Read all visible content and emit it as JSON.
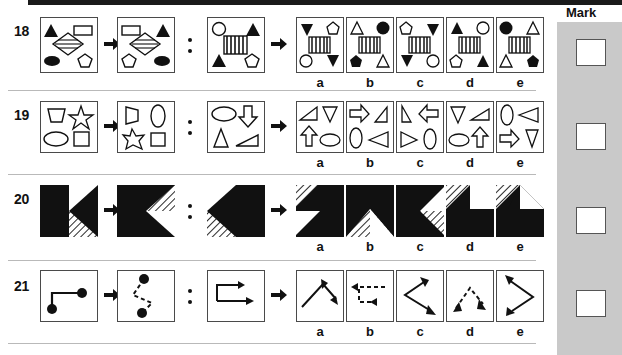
{
  "page": {
    "mark_column_title": "Mark",
    "option_letters": [
      "a",
      "b",
      "c",
      "d",
      "e"
    ],
    "analogy_separator": "colon-dots",
    "arrow_glyph": "right-arrow",
    "colors": {
      "ink": "#111111",
      "cell_border": "#4a4a4a",
      "row_separator": "#b9b9b9",
      "mark_panel_background": "#c9c9c9",
      "top_rule": "#1a1a1a",
      "fill_black": "#111111",
      "fill_white": "#ffffff",
      "hatch": "#777777"
    }
  },
  "questions": [
    {
      "number": "18",
      "description": "Four corner shapes plus central hatched motif; transformation is a left-right mirror flip.",
      "stem": {
        "A": "black-triangle-up TL, white-rectangle TR, hatched-diamond center, black-ellipse BL, white-pentagon BR",
        "B": "white-rectangle TL, black-triangle-up TR, hatched-diamond center, white-pentagon BL, black-ellipse BR",
        "C": "white-circle TL, black-triangle-up TR, striped-square center, black-triangle-up BL, white-pentagon BR"
      },
      "options": [
        "black-triangle-down TL, white-pentagon TR, striped-square center, white-circle BL, black-triangle-down BR",
        "white-triangle-up TL, black-circle TR, striped-square center, black-pentagon BL, white-triangle-up BR",
        "white-pentagon TL, black-triangle-down TR, striped-square center, black-triangle-down BL, white-circle BR",
        "black-triangle-up TL, white-circle TR, striped-square center, white-pentagon BL, black-triangle-up BR",
        "black-circle TL, white-triangle-up TR, striped-square center, white-triangle-up BL, black-pentagon BR"
      ]
    },
    {
      "number": "19",
      "description": "Four outline shapes rotate ninety degrees clockwise within the frame.",
      "stem": {
        "A": "trapezoid TL, star TR, ellipse BL, square BR",
        "B": "trapezoid-rotated TL, ellipse-vertical TR, star BL, square BR",
        "C": "ellipse-horizontal TL, down-arrow TR, triangle BL, right-triangle BR"
      },
      "options": [
        "right-triangle TL, triangle-down TR, up-arrow BL, ellipse-horizontal BR",
        "right-arrow TL, right-triangle TR, ellipse-vertical BL, left-triangle BR",
        "narrow-triangle TL, left-arrow TR, right-triangle BL, ellipse-vertical BR",
        "triangle-down TL, flat-triangle TR, ellipse-horizontal BL, up-arrow BR",
        "ellipse-vertical TL, left-triangle TR, right-arrow BL, narrow-triangle BR"
      ]
    },
    {
      "number": "20",
      "description": "Solid black square with a triangular notch; the notch's white half becomes diagonally hatched.",
      "stem": {
        "A": "black square, white triangle notch pointing left from right edge, lower-right hatched wedge",
        "B": "black square, hatched and white triangle notch pointing left, white lower-right wedge",
        "C": "black square, white triangle notch pointing right from left edge, lower-left hatched wedge"
      },
      "options": [
        "black square with white/hatched triangle pointing right at left edge",
        "black square with hatched and white triangles rising from bottom edge",
        "black square with white and hatched triangle notch pointing left from right edge",
        "black square, upper-left hatched triangle and upper-right white square",
        "black square, upper-left hatched triangle and upper-right white triangle over black band"
      ]
    },
    {
      "number": "21",
      "description": "Solid stepped path with end dots becomes a rotated dashed path; arrowed versions in the options.",
      "stem": {
        "A": "solid step line, black dot at upper-right end and lower-left end",
        "B": "dashed zigzag rotated, black dot at top and bottom ends",
        "C": "solid path with two right-pointing arrowheads, step shape"
      },
      "options": [
        "solid diagonal chevron path with arrowheads at both ends pointing up-right and down-right",
        "dashed horizontal path with left-pointing arrowheads, stepped",
        "solid chevron path with arrowheads pointing up-left and down-right",
        "dashed peaked path with arrowheads pointing down-left and down-right",
        "solid chevron path with arrowheads pointing up-left and down-left"
      ]
    }
  ],
  "mark_boxes": [
    {
      "question": "18",
      "value": ""
    },
    {
      "question": "19",
      "value": ""
    },
    {
      "question": "20",
      "value": ""
    },
    {
      "question": "21",
      "value": ""
    }
  ]
}
